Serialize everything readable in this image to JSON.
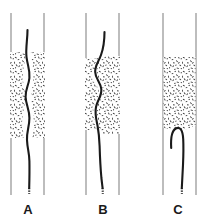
{
  "figure": {
    "type": "medical-illustration",
    "background_color": "#ffffff",
    "vessel_wall_color": "#9a9a9a",
    "wire_color": "#1a1a1a",
    "plaque_color": "#2b2b2b",
    "label_color": "#1a1a1a"
  },
  "panels": [
    {
      "id": "A",
      "label": "A",
      "label_x": 28,
      "label_y": 205,
      "wall_left_x": 11,
      "wall_right_x": 44,
      "wall_top_y": 13,
      "wall_bottom_y": 195,
      "plaque_top_y": 52,
      "plaque_bottom_y": 138,
      "occlusion": "concentric-stenosis",
      "wire_outcome": "crosses-lumen",
      "wire_top_y": 30,
      "wire_tip_y": 188,
      "wire_path": "M27.5,30 C27.5,40 25.5,48 26.5,57 C27.6,66 30.2,70 29.4,78 C28.6,86 25.3,89 25.6,97 C25.9,105 29.4,109 29.4,118 C29.4,127 26.6,131 27.0,140 C27.4,149 29.2,152 29.4,161 C29.6,170 29.4,180 29.2,188",
      "plaque_left": {
        "x": 9.5,
        "width": 18,
        "top": 52,
        "bottom": 138
      },
      "plaque_right": {
        "x": 31,
        "width": 14,
        "top": 52,
        "bottom": 138
      }
    },
    {
      "id": "B",
      "label": "B",
      "label_x": 103,
      "label_y": 205,
      "wall_left_x": 86,
      "wall_right_x": 119,
      "wall_top_y": 13,
      "wall_bottom_y": 195,
      "plaque_top_y": 56,
      "plaque_bottom_y": 134,
      "occlusion": "eccentric-stenosis",
      "wire_outcome": "crosses-serpentine",
      "wire_top_y": 32,
      "wire_tip_y": 188,
      "wire_path": "M104.5,32 C104.5,42 103.5,48 101.0,55 C98.5,62 95.0,65 95.2,72 C95.4,79 100.5,82 101.3,89 C102.1,96 97.4,100 96.0,107 C94.6,114 96.3,119 97.6,126 C98.9,133 99.3,138 99.6,146 C99.9,156 100.5,168 101.4,178 C102.0,183 102.3,186 102.6,188",
      "plaque_left": {
        "x": 84.5,
        "width": 14,
        "top": 58,
        "bottom": 130
      },
      "plaque_right": {
        "x": 97,
        "width": 23,
        "top": 56,
        "bottom": 134
      }
    },
    {
      "id": "C",
      "label": "C",
      "label_x": 178,
      "label_y": 205,
      "wall_left_x": 163,
      "wall_right_x": 196,
      "wall_top_y": 13,
      "wall_bottom_y": 195,
      "plaque_top_y": 57,
      "plaque_bottom_y": 129,
      "occlusion": "total-occlusion",
      "wire_outcome": "buckles-into-hook",
      "wire_top_y": 127,
      "wire_tip_y": 188,
      "wire_path": "M171.2,148 C170.6,138 171.4,131 175.8,128.5 C180.4,126 182.8,131 183.2,139 C183.6,147 183.4,156 183.0,165 C182.6,174 182.2,181 181.8,188",
      "plaque_left": {
        "x": 163.5,
        "width": 32,
        "top": 57,
        "bottom": 129
      },
      "plaque_right": null
    }
  ],
  "labels": {
    "panel_a": "A",
    "panel_b": "B",
    "panel_c": "C"
  }
}
